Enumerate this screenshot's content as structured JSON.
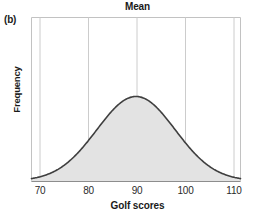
{
  "figure": {
    "panel_label": "(b)",
    "title": "Mean",
    "xlabel": "Golf scores",
    "ylabel": "Frequency"
  },
  "style": {
    "curve_color": "#3f3f3f",
    "fill_color": "#e2e2e2",
    "grid_color": "#c9c9c9",
    "frame_color": "#bdbdbd",
    "text_color": "#1a1a1a",
    "background": "#ffffff"
  },
  "chart_data": {
    "type": "line",
    "title": "Mean",
    "subtitle": "(b)",
    "xlabel": "Golf scores",
    "ylabel": "Frequency",
    "xlim": [
      66,
      114
    ],
    "ylim": [
      0,
      1
    ],
    "xticks": [
      70,
      80,
      90,
      100,
      110
    ],
    "xtick_labels": [
      "70",
      "80",
      "90",
      "100",
      "110"
    ],
    "yticks": [],
    "ytick_labels": [],
    "grid": "vertical-only",
    "legend": "none",
    "annotations": [
      {
        "text": "Mean",
        "x": 90,
        "position": "above-plot-center"
      }
    ],
    "distribution": {
      "shape": "normal",
      "mean": 90,
      "std_dev": 9.0,
      "peak_x": 90,
      "peak_y": 1.0,
      "fill": "shaded",
      "baseline_y": 0
    },
    "x": [
      66,
      68,
      70,
      72,
      74,
      76,
      78,
      80,
      82,
      84,
      86,
      88,
      90,
      92,
      94,
      96,
      98,
      100,
      102,
      104,
      106,
      108,
      110,
      112,
      114
    ],
    "values": [
      0.009,
      0.018,
      0.034,
      0.061,
      0.103,
      0.165,
      0.249,
      0.355,
      0.477,
      0.602,
      0.717,
      0.807,
      0.865,
      0.885,
      0.865,
      0.807,
      0.717,
      0.602,
      0.477,
      0.355,
      0.249,
      0.165,
      0.103,
      0.061,
      0.034
    ]
  }
}
